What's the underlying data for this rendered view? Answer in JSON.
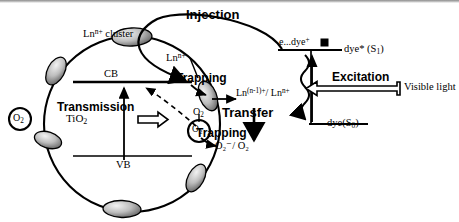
{
  "figure": {
    "background_color": "#ffffff",
    "stroke_color": "#000000"
  },
  "process_labels": {
    "injection": "Injection",
    "trapping_upper": "Trapping",
    "trapping_lower": "Trapping",
    "transmission": "Transmission",
    "transfer": "Transfer",
    "excitation": "Excitation"
  },
  "sphere": {
    "cluster_label": "Ln",
    "cluster_label_sup": "n+",
    "cluster_label_tail": " cluster",
    "ln_ion": "Ln",
    "ln_ion_sup": "n+",
    "semiconductor": "TiO",
    "semiconductor_sub": "2",
    "conduction_band": "CB",
    "valence_band": "VB"
  },
  "species": {
    "oxygen_left": "O",
    "oxygen_left_sub": "2",
    "oxygen_right": "O",
    "oxygen_right_sub": "2",
    "oxygen_top_right": "O",
    "oxygen_top_right_sub": "2",
    "superoxide_couple": "O₂⁻/ O₂",
    "lanthanide_couple_a": "Ln",
    "lanthanide_couple_a_sup": "(n-1)+",
    "lanthanide_couple_b": "/ Ln",
    "lanthanide_couple_b_sup": "n+"
  },
  "dye_levels": {
    "excited_state_label": "dye* (S",
    "excited_state_sub": "1",
    "excited_state_tail": ")",
    "ground_state_label": "dye(S",
    "ground_state_sub": "0",
    "ground_state_tail": ")",
    "electron_dye_cation": "e...dye",
    "electron_dye_cation_sup": "+",
    "light_source": "Visible light"
  }
}
